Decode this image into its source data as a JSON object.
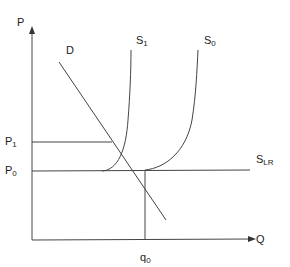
{
  "diagram": {
    "title": "",
    "axes": {
      "y_label": "P",
      "x_label": "Q"
    },
    "curves": {
      "demand": {
        "label": "D"
      },
      "supply_1": {
        "label": "S",
        "sub": "1"
      },
      "supply_0": {
        "label": "S",
        "sub": "0"
      },
      "supply_lr": {
        "label": "S",
        "sub": "LR"
      }
    },
    "price_levels": {
      "p1": {
        "label": "P",
        "sub": "1"
      },
      "p0": {
        "label": "P",
        "sub": "0"
      }
    },
    "quantity_levels": {
      "q0": {
        "label": "q",
        "sub": "0"
      }
    },
    "colors": {
      "line": "#444444",
      "text": "#222222",
      "background": "#ffffff"
    }
  }
}
